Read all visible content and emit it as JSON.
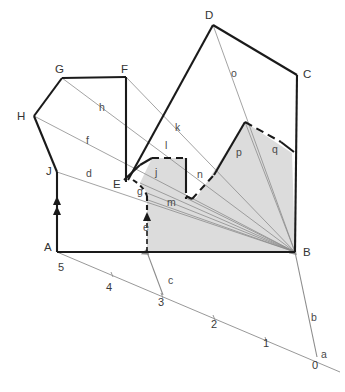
{
  "figure": {
    "type": "geometric-construction-diagram",
    "background_color": "#ffffff",
    "shade_color": "#dcdcdc",
    "line_color": "#1a1a1a",
    "thin_line_color": "#8c8c8c"
  },
  "vertices": [
    {
      "id": "A",
      "label": "A",
      "x": 57,
      "y": 252,
      "lx": 44,
      "ly": 251
    },
    {
      "id": "B",
      "label": "B",
      "x": 295,
      "y": 252,
      "lx": 303,
      "ly": 254
    },
    {
      "id": "C",
      "label": "C",
      "x": 297,
      "y": 75,
      "lx": 303,
      "ly": 74
    },
    {
      "id": "D",
      "label": "D",
      "x": 213,
      "y": 25,
      "lx": 205,
      "ly": 17
    },
    {
      "id": "E",
      "label": "E",
      "x": 122,
      "y": 180,
      "lx": 117,
      "ly": 187
    },
    {
      "id": "F",
      "label": "F",
      "x": 126,
      "y": 77,
      "lx": 122,
      "ly": 72
    },
    {
      "id": "G",
      "label": "G",
      "x": 62,
      "y": 78,
      "lx": 57,
      "ly": 72
    },
    {
      "id": "H",
      "label": "H",
      "x": 34,
      "y": 116,
      "lx": 20,
      "ly": 118
    },
    {
      "id": "J",
      "label": "J",
      "x": 57,
      "y": 172,
      "lx": 47,
      "ly": 173
    }
  ],
  "segment_labels": [
    {
      "id": "d",
      "label": "d",
      "x": 88,
      "y": 174
    },
    {
      "id": "f",
      "label": "f",
      "x": 88,
      "y": 141
    },
    {
      "id": "h",
      "label": "h",
      "x": 101,
      "y": 108
    },
    {
      "id": "k",
      "label": "k",
      "x": 177,
      "y": 128
    },
    {
      "id": "o",
      "label": "o",
      "x": 233,
      "y": 74
    },
    {
      "id": "l",
      "label": "l",
      "x": 166,
      "y": 146
    },
    {
      "id": "j",
      "label": "j",
      "x": 157,
      "y": 173
    },
    {
      "id": "n",
      "label": "n",
      "x": 199,
      "y": 175
    },
    {
      "id": "p",
      "label": "p",
      "x": 238,
      "y": 153
    },
    {
      "id": "q",
      "label": "q",
      "x": 274,
      "y": 150
    },
    {
      "id": "g",
      "label": "g",
      "x": 139,
      "y": 192
    },
    {
      "id": "m",
      "label": "m",
      "x": 169,
      "y": 203
    },
    {
      "id": "e",
      "label": "e",
      "x": 145,
      "y": 228
    },
    {
      "id": "c",
      "label": "c",
      "x": 170,
      "y": 281
    },
    {
      "id": "b",
      "label": "b",
      "x": 313,
      "y": 318
    },
    {
      "id": "a",
      "label": "a",
      "x": 323,
      "y": 355
    }
  ],
  "scale": {
    "ticks": [
      {
        "value": "5",
        "x": 61,
        "y": 270
      },
      {
        "value": "4",
        "x": 109,
        "y": 288
      },
      {
        "value": "3",
        "x": 160,
        "y": 303
      },
      {
        "value": "2",
        "x": 214,
        "y": 325
      },
      {
        "value": "1",
        "x": 265,
        "y": 344
      },
      {
        "value": "0",
        "x": 314,
        "y": 366
      }
    ]
  }
}
